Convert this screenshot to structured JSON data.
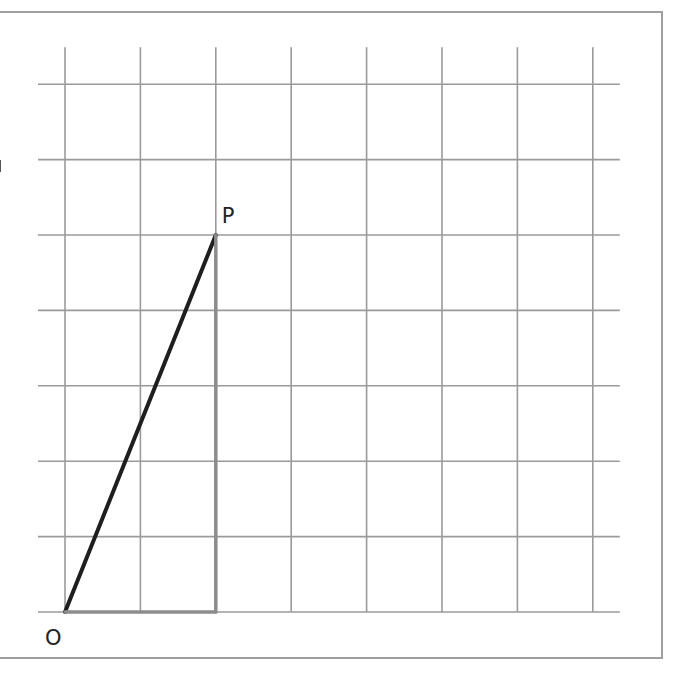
{
  "diagram": {
    "type": "grid-triangle",
    "grid": {
      "columns": 7,
      "rows": 7
    },
    "points": [
      {
        "name": "O",
        "label": "O",
        "x": 0,
        "y": 0
      },
      {
        "name": "P",
        "label": "P",
        "x": 2,
        "y": 5
      }
    ],
    "segments": [
      {
        "from": [
          0,
          0
        ],
        "to": [
          2,
          5
        ],
        "style": "bold",
        "name": "segment-op"
      },
      {
        "from": [
          2,
          5
        ],
        "to": [
          2,
          0
        ],
        "style": "grey",
        "name": "segment-p-foot"
      },
      {
        "from": [
          0,
          0
        ],
        "to": [
          2,
          0
        ],
        "style": "grey",
        "name": "segment-o-foot"
      }
    ],
    "colors": {
      "grid": "#9a9a9a",
      "bold": "#1e1e1e",
      "grey": "#8c8c8c",
      "frame": "#9e9e9e"
    }
  }
}
